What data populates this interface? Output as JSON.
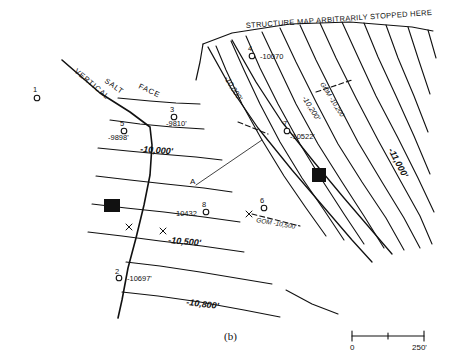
{
  "figure": {
    "caption": "(b)",
    "header_note": "STRUCTURE MAP ARBITRARILY STOPPED HERE",
    "fault_labels": {
      "vertical": "VERTICAL",
      "salt": "SALT",
      "face": "FACE"
    }
  },
  "contours": [
    {
      "id": "c10000",
      "label": "-10,000'"
    },
    {
      "id": "c10200",
      "label": "-10,200'"
    },
    {
      "id": "c10500",
      "label": "-10,500'"
    },
    {
      "id": "c10800",
      "label": "-10,800'"
    },
    {
      "id": "c11000",
      "label": "-11,000'"
    }
  ],
  "fault_cut_labels": [
    {
      "id": "fc10000",
      "label": "-10,000'"
    },
    {
      "id": "fc10200",
      "label": "-10,200'"
    },
    {
      "id": "fcgom10200",
      "label": "GOM -10,200'"
    },
    {
      "id": "fcgom10500",
      "label": "GOM -10,500'"
    }
  ],
  "wells": [
    {
      "id": "w1",
      "number": "1",
      "value": ""
    },
    {
      "id": "w2",
      "number": "2",
      "value": "-10697'"
    },
    {
      "id": "w3",
      "number": "3",
      "value": "-9810'"
    },
    {
      "id": "w4",
      "number": "4",
      "value": "-10070"
    },
    {
      "id": "w5",
      "number": "5",
      "value": "-9898'"
    },
    {
      "id": "w6",
      "number": "6",
      "value": ""
    },
    {
      "id": "w7",
      "number": "7",
      "value": "-10522'"
    },
    {
      "id": "w8",
      "number": "8",
      "value": "10432"
    }
  ],
  "point_labels": [
    {
      "id": "ptA",
      "label": "A"
    }
  ],
  "scale_bar": {
    "left_label": "0",
    "right_label": "250'"
  },
  "colors": {
    "ink": "#0f0f0f",
    "background": "#ffffff"
  }
}
